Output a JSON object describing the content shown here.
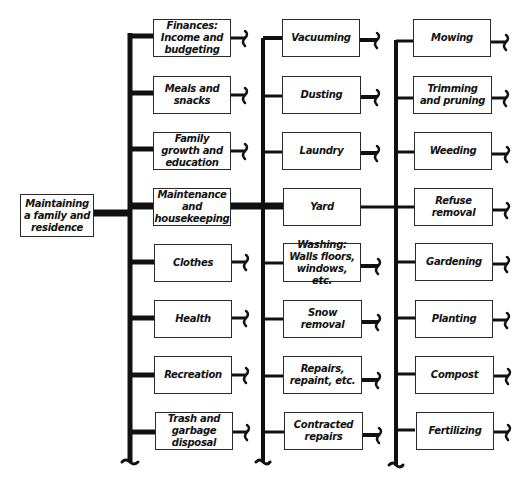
{
  "diagram": {
    "type": "tree",
    "root": {
      "label": "Maintaining a family and residence"
    },
    "level1": [
      {
        "label": "Finances: Income and budgeting"
      },
      {
        "label": "Meals and snacks"
      },
      {
        "label": "Family growth and education"
      },
      {
        "label": "Maintenance and housekeeping"
      },
      {
        "label": "Clothes"
      },
      {
        "label": "Health"
      },
      {
        "label": "Recreation"
      },
      {
        "label": "Trash and garbage disposal"
      }
    ],
    "level2_parent": "Maintenance and housekeeping",
    "level2": [
      {
        "label": "Vacuuming"
      },
      {
        "label": "Dusting"
      },
      {
        "label": "Laundry"
      },
      {
        "label": "Yard"
      },
      {
        "label": "Washing: Walls floors, windows, etc."
      },
      {
        "label": "Snow removal"
      },
      {
        "label": "Repairs, repaint, etc."
      },
      {
        "label": "Contracted repairs"
      }
    ],
    "level3_parent": "Yard",
    "level3": [
      {
        "label": "Mowing"
      },
      {
        "label": "Trimming and pruning"
      },
      {
        "label": "Weeding"
      },
      {
        "label": "Refuse removal"
      },
      {
        "label": "Gardening"
      },
      {
        "label": "Planting"
      },
      {
        "label": "Compost"
      },
      {
        "label": "Fertilizing"
      }
    ]
  }
}
